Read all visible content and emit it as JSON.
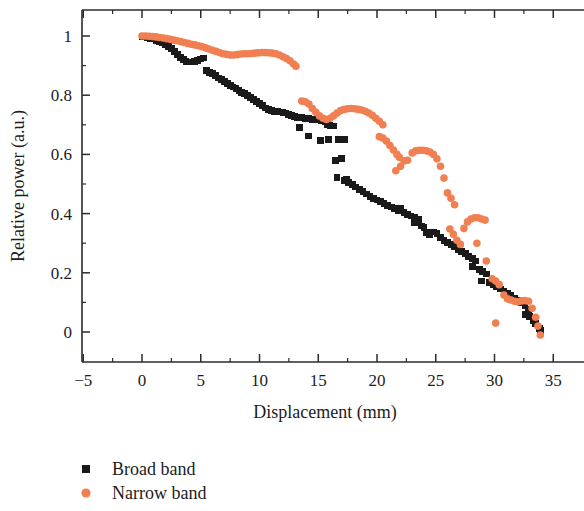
{
  "chart_data": {
    "type": "scatter",
    "title": "",
    "xlabel": "Displacement (mm)",
    "ylabel": "Relative power (a.u.)",
    "xlim": [
      -6.5,
      37.5
    ],
    "ylim": [
      -0.1,
      1.06
    ],
    "xticks": [
      -5,
      0,
      5,
      10,
      15,
      20,
      25,
      30,
      35
    ],
    "xtick_labels": [
      "−5",
      "0",
      "5",
      "10",
      "15",
      "20",
      "25",
      "30",
      "35"
    ],
    "yticks": [
      0,
      0.2,
      0.4,
      0.6,
      0.8,
      1
    ],
    "ytick_labels": [
      "0",
      "0.2",
      "0.4",
      "0.6",
      "0.8",
      "1"
    ],
    "x_minor_interval": 2.5,
    "y_minor_interval": 0.1,
    "grid": false,
    "legend_position": "below-left",
    "colors": {
      "broad_band": "#1a1a1a",
      "narrow_band": "#F07F52",
      "axis": "#2b2b2b",
      "background": "#ffffff"
    },
    "series": [
      {
        "name": "Broad band",
        "marker": "square",
        "color": "#1a1a1a",
        "points": [
          [
            0.0,
            0.998
          ],
          [
            0.25,
            0.997
          ],
          [
            0.5,
            0.995
          ],
          [
            0.75,
            0.992
          ],
          [
            1.0,
            0.99
          ],
          [
            1.25,
            0.985
          ],
          [
            1.5,
            0.982
          ],
          [
            1.75,
            0.978
          ],
          [
            2.0,
            0.972
          ],
          [
            2.25,
            0.965
          ],
          [
            2.5,
            0.957
          ],
          [
            2.75,
            0.948
          ],
          [
            3.0,
            0.938
          ],
          [
            3.25,
            0.928
          ],
          [
            3.5,
            0.92
          ],
          [
            3.75,
            0.915
          ],
          [
            4.0,
            0.912
          ],
          [
            4.25,
            0.912
          ],
          [
            4.5,
            0.914
          ],
          [
            4.75,
            0.918
          ],
          [
            5.0,
            0.922
          ],
          [
            5.25,
            0.926
          ],
          [
            5.5,
            0.884
          ],
          [
            5.75,
            0.878
          ],
          [
            6.0,
            0.872
          ],
          [
            6.25,
            0.866
          ],
          [
            6.5,
            0.858
          ],
          [
            6.75,
            0.852
          ],
          [
            7.0,
            0.845
          ],
          [
            7.25,
            0.84
          ],
          [
            7.5,
            0.834
          ],
          [
            7.75,
            0.828
          ],
          [
            8.0,
            0.822
          ],
          [
            8.25,
            0.816
          ],
          [
            8.5,
            0.81
          ],
          [
            8.75,
            0.805
          ],
          [
            9.0,
            0.8
          ],
          [
            9.25,
            0.793
          ],
          [
            9.5,
            0.786
          ],
          [
            9.75,
            0.78
          ],
          [
            10.0,
            0.772
          ],
          [
            10.25,
            0.764
          ],
          [
            10.5,
            0.757
          ],
          [
            10.75,
            0.752
          ],
          [
            11.0,
            0.748
          ],
          [
            11.25,
            0.745
          ],
          [
            11.5,
            0.744
          ],
          [
            11.75,
            0.743
          ],
          [
            12.0,
            0.742
          ],
          [
            12.25,
            0.74
          ],
          [
            12.5,
            0.736
          ],
          [
            12.75,
            0.732
          ],
          [
            13.0,
            0.729
          ],
          [
            13.25,
            0.726
          ],
          [
            13.4,
            0.69
          ],
          [
            13.6,
            0.724
          ],
          [
            13.9,
            0.722
          ],
          [
            14.2,
            0.72
          ],
          [
            14.5,
            0.718
          ],
          [
            14.2,
            0.662
          ],
          [
            15.0,
            0.716
          ],
          [
            15.3,
            0.714
          ],
          [
            15.6,
            0.71
          ],
          [
            15.2,
            0.646
          ],
          [
            15.8,
            0.7
          ],
          [
            16.0,
            0.698
          ],
          [
            16.3,
            0.696
          ],
          [
            15.9,
            0.65
          ],
          [
            16.7,
            0.651
          ],
          [
            16.5,
            0.58
          ],
          [
            17.2,
            0.65
          ],
          [
            17.0,
            0.585
          ],
          [
            16.6,
            0.523
          ],
          [
            17.4,
            0.516
          ],
          [
            17.2,
            0.512
          ],
          [
            17.6,
            0.505
          ],
          [
            17.9,
            0.498
          ],
          [
            18.2,
            0.49
          ],
          [
            18.5,
            0.482
          ],
          [
            18.8,
            0.474
          ],
          [
            19.1,
            0.466
          ],
          [
            19.4,
            0.458
          ],
          [
            19.7,
            0.45
          ],
          [
            20.0,
            0.446
          ],
          [
            20.3,
            0.44
          ],
          [
            20.6,
            0.434
          ],
          [
            20.9,
            0.428
          ],
          [
            21.2,
            0.422
          ],
          [
            21.5,
            0.416
          ],
          [
            21.8,
            0.41
          ],
          [
            22.0,
            0.418
          ],
          [
            22.3,
            0.404
          ],
          [
            22.6,
            0.398
          ],
          [
            22.9,
            0.392
          ],
          [
            23.2,
            0.386
          ],
          [
            23.5,
            0.38
          ],
          [
            23.2,
            0.368
          ],
          [
            23.8,
            0.358
          ],
          [
            24.0,
            0.352
          ],
          [
            24.2,
            0.336
          ],
          [
            24.5,
            0.33
          ],
          [
            24.8,
            0.338
          ],
          [
            25.1,
            0.332
          ],
          [
            25.4,
            0.318
          ],
          [
            25.7,
            0.31
          ],
          [
            26.0,
            0.302
          ],
          [
            26.3,
            0.295
          ],
          [
            26.6,
            0.288
          ],
          [
            26.9,
            0.28
          ],
          [
            27.2,
            0.272
          ],
          [
            27.5,
            0.264
          ],
          [
            27.8,
            0.256
          ],
          [
            28.1,
            0.248
          ],
          [
            28.4,
            0.24
          ],
          [
            28.1,
            0.22
          ],
          [
            28.7,
            0.212
          ],
          [
            29.0,
            0.205
          ],
          [
            29.3,
            0.196
          ],
          [
            28.9,
            0.172
          ],
          [
            29.6,
            0.168
          ],
          [
            29.9,
            0.16
          ],
          [
            30.2,
            0.152
          ],
          [
            30.5,
            0.145
          ],
          [
            30.8,
            0.138
          ],
          [
            31.1,
            0.13
          ],
          [
            31.4,
            0.122
          ],
          [
            31.7,
            0.115
          ],
          [
            32.0,
            0.108
          ],
          [
            32.3,
            0.098
          ],
          [
            32.6,
            0.088
          ],
          [
            32.9,
            0.075
          ],
          [
            32.6,
            0.06
          ],
          [
            33.0,
            0.052
          ],
          [
            33.3,
            0.04
          ],
          [
            33.5,
            0.03
          ],
          [
            33.7,
            0.02
          ],
          [
            33.8,
            0.012
          ],
          [
            33.9,
            0.005
          ]
        ]
      },
      {
        "name": "Narrow band",
        "marker": "circle",
        "color": "#F07F52",
        "points": [
          [
            0.0,
            1.0
          ],
          [
            0.3,
            1.0
          ],
          [
            0.6,
            0.999
          ],
          [
            0.9,
            0.998
          ],
          [
            1.2,
            0.997
          ],
          [
            1.5,
            0.995
          ],
          [
            1.8,
            0.993
          ],
          [
            2.1,
            0.991
          ],
          [
            2.4,
            0.989
          ],
          [
            2.7,
            0.986
          ],
          [
            3.0,
            0.984
          ],
          [
            3.3,
            0.981
          ],
          [
            3.6,
            0.978
          ],
          [
            3.9,
            0.975
          ],
          [
            4.2,
            0.972
          ],
          [
            4.5,
            0.97
          ],
          [
            4.8,
            0.967
          ],
          [
            5.1,
            0.964
          ],
          [
            5.4,
            0.96
          ],
          [
            5.7,
            0.956
          ],
          [
            6.0,
            0.952
          ],
          [
            6.3,
            0.948
          ],
          [
            6.6,
            0.944
          ],
          [
            6.9,
            0.94
          ],
          [
            7.2,
            0.938
          ],
          [
            7.5,
            0.936
          ],
          [
            7.8,
            0.936
          ],
          [
            8.1,
            0.937
          ],
          [
            8.4,
            0.939
          ],
          [
            8.7,
            0.94
          ],
          [
            9.0,
            0.94
          ],
          [
            9.3,
            0.941
          ],
          [
            9.6,
            0.942
          ],
          [
            9.9,
            0.943
          ],
          [
            10.2,
            0.944
          ],
          [
            10.5,
            0.944
          ],
          [
            10.8,
            0.943
          ],
          [
            11.1,
            0.942
          ],
          [
            11.4,
            0.94
          ],
          [
            11.7,
            0.936
          ],
          [
            12.0,
            0.93
          ],
          [
            12.3,
            0.924
          ],
          [
            12.6,
            0.916
          ],
          [
            12.9,
            0.905
          ],
          [
            13.1,
            0.898
          ],
          [
            13.6,
            0.78
          ],
          [
            13.9,
            0.778
          ],
          [
            14.2,
            0.77
          ],
          [
            14.5,
            0.755
          ],
          [
            14.8,
            0.742
          ],
          [
            15.1,
            0.73
          ],
          [
            15.4,
            0.722
          ],
          [
            15.7,
            0.718
          ],
          [
            16.0,
            0.722
          ],
          [
            16.3,
            0.73
          ],
          [
            16.6,
            0.74
          ],
          [
            16.9,
            0.748
          ],
          [
            17.2,
            0.752
          ],
          [
            17.5,
            0.754
          ],
          [
            17.8,
            0.755
          ],
          [
            18.1,
            0.754
          ],
          [
            18.4,
            0.752
          ],
          [
            18.7,
            0.75
          ],
          [
            19.0,
            0.746
          ],
          [
            19.3,
            0.74
          ],
          [
            19.6,
            0.732
          ],
          [
            19.9,
            0.722
          ],
          [
            20.2,
            0.712
          ],
          [
            20.5,
            0.7
          ],
          [
            20.2,
            0.66
          ],
          [
            20.5,
            0.655
          ],
          [
            20.8,
            0.645
          ],
          [
            21.1,
            0.63
          ],
          [
            21.4,
            0.615
          ],
          [
            21.7,
            0.6
          ],
          [
            21.9,
            0.59
          ],
          [
            21.6,
            0.545
          ],
          [
            22.0,
            0.56
          ],
          [
            22.3,
            0.578
          ],
          [
            22.6,
            0.58
          ],
          [
            23.0,
            0.605
          ],
          [
            23.3,
            0.612
          ],
          [
            23.6,
            0.614
          ],
          [
            23.9,
            0.614
          ],
          [
            24.2,
            0.612
          ],
          [
            24.5,
            0.608
          ],
          [
            24.8,
            0.6
          ],
          [
            25.1,
            0.585
          ],
          [
            25.4,
            0.56
          ],
          [
            25.7,
            0.52
          ],
          [
            26.0,
            0.47
          ],
          [
            26.3,
            0.452
          ],
          [
            26.6,
            0.43
          ],
          [
            26.2,
            0.348
          ],
          [
            26.5,
            0.33
          ],
          [
            26.8,
            0.31
          ],
          [
            27.1,
            0.296
          ],
          [
            27.4,
            0.35
          ],
          [
            27.7,
            0.372
          ],
          [
            28.0,
            0.382
          ],
          [
            28.3,
            0.386
          ],
          [
            28.6,
            0.386
          ],
          [
            28.9,
            0.382
          ],
          [
            29.2,
            0.378
          ],
          [
            28.5,
            0.3
          ],
          [
            29.3,
            0.24
          ],
          [
            29.8,
            0.18
          ],
          [
            30.1,
            0.172
          ],
          [
            30.4,
            0.16
          ],
          [
            30.1,
            0.03
          ],
          [
            30.8,
            0.125
          ],
          [
            31.1,
            0.112
          ],
          [
            31.4,
            0.108
          ],
          [
            31.7,
            0.104
          ],
          [
            32.0,
            0.102
          ],
          [
            32.3,
            0.105
          ],
          [
            32.6,
            0.106
          ],
          [
            32.9,
            0.104
          ],
          [
            33.2,
            0.08
          ],
          [
            33.5,
            0.05
          ],
          [
            33.7,
            0.02
          ],
          [
            33.9,
            -0.01
          ]
        ]
      }
    ]
  },
  "legend": {
    "items": [
      {
        "label": "Broad band",
        "marker": "square",
        "color": "#1a1a1a"
      },
      {
        "label": "Narrow band",
        "marker": "circle",
        "color": "#F07F52"
      }
    ]
  }
}
